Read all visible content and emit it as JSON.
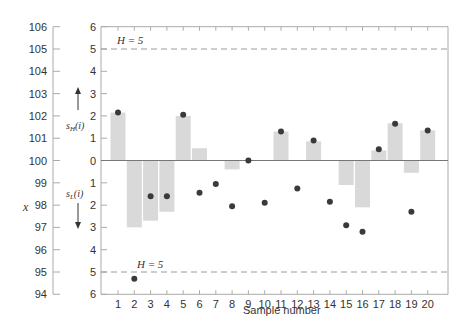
{
  "chart_data": {
    "type": "bar",
    "title": "",
    "xlabel": "Sample number",
    "ylabel_left": "x",
    "left_axis": {
      "ticks": [
        94,
        95,
        96,
        97,
        98,
        99,
        100,
        101,
        102,
        103,
        104,
        105,
        106
      ],
      "ylim": [
        94,
        106
      ]
    },
    "right_axis": {
      "ticks": [
        "6",
        "5",
        "4",
        "3",
        "2",
        "1",
        "0",
        "1",
        "2",
        "3",
        "4",
        "5",
        "6"
      ]
    },
    "categories": [
      1,
      2,
      3,
      4,
      5,
      6,
      7,
      8,
      9,
      10,
      11,
      12,
      13,
      14,
      15,
      16,
      17,
      18,
      19,
      20
    ],
    "series": [
      {
        "name": "CUSUM (s_H(i) above, s_L(i) below)",
        "type": "bar",
        "values": [
          2.15,
          -3.0,
          -2.7,
          -2.3,
          2.0,
          0.55,
          0,
          -0.4,
          0,
          0,
          1.3,
          0,
          0.86,
          0,
          -1.1,
          -2.1,
          0.45,
          1.67,
          -0.55,
          1.35
        ]
      },
      {
        "name": "Observations x",
        "type": "scatter",
        "values": [
          102.15,
          94.7,
          98.4,
          98.4,
          102.05,
          98.55,
          98.95,
          97.95,
          100.0,
          98.1,
          101.3,
          98.75,
          100.9,
          98.15,
          97.1,
          96.8,
          100.5,
          101.65,
          97.7,
          101.35
        ]
      }
    ],
    "annotations": [
      {
        "text": "H = 5",
        "position": "upper decision interval",
        "value": 5
      },
      {
        "text": "H = 5",
        "position": "lower decision interval",
        "value": -5
      },
      {
        "text": "s_H(i)",
        "direction": "up"
      },
      {
        "text": "s_L(i)",
        "direction": "down"
      }
    ],
    "grid": false,
    "legend": "none"
  },
  "labels": {
    "xlabel": "Sample number",
    "ylabel": "x",
    "h_upper": "H = 5",
    "h_lower": "H = 5",
    "sh": "s",
    "sh_sub": "H",
    "sh_arg": "(i)",
    "sl": "s",
    "sl_sub": "L",
    "sl_arg": "(i)"
  },
  "colors": {
    "bar": "#d9d9d9",
    "dot": "#3a3a3a",
    "axis": "#aaaaaa",
    "dash": "#9a9a9a"
  }
}
